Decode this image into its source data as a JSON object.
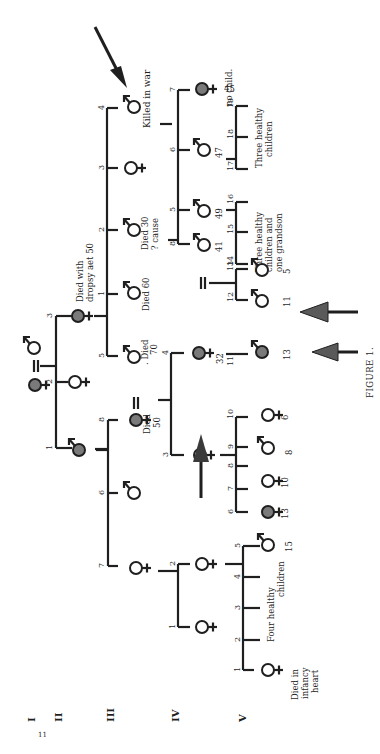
{
  "figure": {
    "caption": "Figure 1.",
    "page_number": "11",
    "orientation": "rotated 90° clockwise (read with page turned)",
    "generations": [
      "I",
      "II",
      "III",
      "IV",
      "V"
    ]
  },
  "labels": {
    "gen_I": "I",
    "gen_II": "II",
    "gen_III": "III",
    "gen_IV": "IV",
    "gen_V": "V",
    "page_no": "11",
    "caption": "FIGURE 1.",
    "killed_in_war": "Killed in war",
    "no_child": "no child.",
    "age_45": "45",
    "three_healthy_1": "Three healthy",
    "three_healthy_2": "children",
    "age_47": "47",
    "died30_1": "Died 30",
    "died30_2": "? cause",
    "age_49": "49",
    "three_healthy_gs_1": "Three healthy",
    "three_healthy_gs_2": "children and",
    "three_healthy_gs_3": "one grandson",
    "died60": "Died 60",
    "age_41": "41",
    "dropsy_1": "Died with",
    "dropsy_2": "dropsy aet 50",
    "died70_1": ". Died",
    "died70_2": "70",
    "died50_1": "Died",
    "died50_2": "50",
    "age_32": "32",
    "age_5": "5",
    "age_11": "11",
    "age_13a": "13",
    "age_6": "6",
    "age_8": "8",
    "age_10": "10",
    "age_13b": "13",
    "age_15": "15",
    "four_healthy_1": "Four healthy",
    "four_healthy_2": "children",
    "died_infancy_1": "Died in",
    "died_infancy_2": "infancy",
    "died_infancy_3": "heart",
    "n1": "1",
    "n2": "2",
    "n3": "3",
    "n4": "4",
    "n5": "5",
    "n6": "6",
    "n7": "7",
    "n8": "8",
    "n9": "9",
    "n10": "10",
    "n11": "11",
    "n12": "12",
    "n13": "13",
    "n14": "14",
    "n15": "15",
    "n16": "16",
    "n17": "17",
    "n18": "18",
    "n19": "19"
  },
  "pedigree": {
    "I": [
      {
        "id": "I-female",
        "sex": "female",
        "affected": true
      },
      {
        "id": "I-male",
        "sex": "male",
        "affected": false
      }
    ],
    "II": [
      {
        "n": 1,
        "sex": "male",
        "affected": true
      },
      {
        "n": 2,
        "sex": "female",
        "affected": false
      },
      {
        "n": 3,
        "sex": "female",
        "affected": true,
        "note": "Died with dropsy aet 50"
      }
    ],
    "III": [
      {
        "n": 1,
        "sex": "male",
        "note": "Died 60"
      },
      {
        "n": 2,
        "sex": "male",
        "note": "Died 30 ? cause"
      },
      {
        "n": 3,
        "sex": "female"
      },
      {
        "n": 4,
        "sex": "male",
        "note": "Killed in war",
        "proband_arrow": true
      },
      {
        "n": 5,
        "sex": "male",
        "note": ". Died 70"
      },
      {
        "n": 6,
        "sex": "male"
      },
      {
        "n": 7,
        "sex": "female"
      },
      {
        "n": 8,
        "sex": "female",
        "affected": true,
        "note": "Died 50"
      }
    ],
    "IV": [
      {
        "n": 1,
        "sex": "female"
      },
      {
        "n": 2,
        "sex": "female"
      },
      {
        "n": 3,
        "sex": "female",
        "arrow": true
      },
      {
        "n": 4,
        "sex": "female",
        "affected": true,
        "age": "32"
      },
      {
        "n": 5,
        "sex": "male",
        "age": "49"
      },
      {
        "n": 6,
        "sex": "male",
        "age": "47"
      },
      {
        "n": 7,
        "sex": "female",
        "affected": true,
        "age": "45",
        "note": "no child."
      },
      {
        "n": 8,
        "sex": "male",
        "age": "41"
      }
    ],
    "V": [
      {
        "n": 1,
        "sex": "female",
        "note": "Died in infancy heart"
      },
      {
        "n": "2-5",
        "note": "Four healthy children"
      },
      {
        "n": 6,
        "sex": "male",
        "age": "15"
      },
      {
        "n": 7,
        "sex": "female",
        "affected": true,
        "age": "13"
      },
      {
        "n": 8,
        "sex": "female",
        "age": "10"
      },
      {
        "n": 9,
        "sex": "male",
        "age": "8"
      },
      {
        "n": 10,
        "sex": "female",
        "age": "6"
      },
      {
        "n": 11,
        "sex": "male",
        "affected": true,
        "age": "13",
        "arrow": true
      },
      {
        "n": 12,
        "sex": "male",
        "age": "11",
        "arrow": true
      },
      {
        "n": 13,
        "sex": "male",
        "age": "5"
      },
      {
        "n": "14-16",
        "note": "Three healthy children and one grandson"
      },
      {
        "n": "17-19",
        "note": "Three healthy children"
      }
    ]
  },
  "colors": {
    "ink": "#1f1f1f",
    "affected_fill": "#7a7a7a",
    "background": "#ffffff"
  }
}
